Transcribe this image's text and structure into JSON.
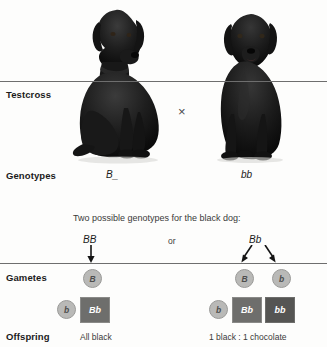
{
  "figure": {
    "rows": {
      "testcross_label": "Testcross",
      "genotypes_label": "Genotypes",
      "gametes_label": "Gametes",
      "offspring_label": "Offspring"
    },
    "cross_symbol": "×",
    "parents": [
      {
        "name": "black-labrador",
        "genotype": "B_",
        "coat": "black"
      },
      {
        "name": "chocolate-labrador",
        "genotype": "bb",
        "coat": "chocolate"
      }
    ],
    "note": "Two possible genotypes for the black dog:",
    "conjunction": "or",
    "branches": [
      {
        "id": "left",
        "parent_genotype": "BB",
        "gametes": [
          "B"
        ],
        "tester_gamete": "b",
        "offspring": [
          {
            "genotype": "Bb",
            "phenotype": "black"
          }
        ],
        "result": "All black"
      },
      {
        "id": "right",
        "parent_genotype": "Bb",
        "gametes": [
          "B",
          "b"
        ],
        "tester_gamete": "b",
        "offspring": [
          {
            "genotype": "Bb",
            "phenotype": "black"
          },
          {
            "genotype": "bb",
            "phenotype": "chocolate"
          }
        ],
        "result": "1 black : 1 chocolate"
      }
    ],
    "colors": {
      "rule": "#6e6e6e",
      "gamete_fill": "#b9b9b7",
      "black_box": "#6e6e6c",
      "chocolate_box": "#555553",
      "text": "#1b1b1b"
    }
  }
}
